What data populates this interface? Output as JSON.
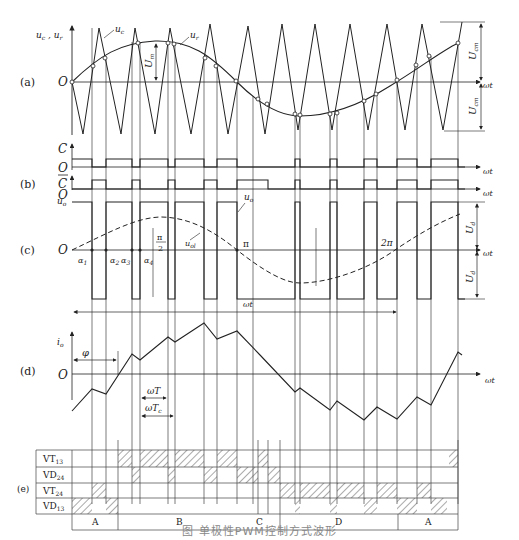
{
  "figure": {
    "caption": "图  单极性PWM控制方式波形",
    "panels": {
      "a": {
        "tag": "(a)",
        "y_axis_label": "u_c , u_r",
        "origin_label": "O",
        "x_axis_label": "ωt",
        "carrier_label": "u_c",
        "reference_label": "u_r",
        "amplitude_label_ref": "U_m",
        "amplitude_label_carrier_pos": "U_cm",
        "amplitude_label_carrier_neg": "U_cm"
      },
      "b": {
        "tag": "(b)",
        "signal_c_label": "C",
        "signal_cbar_label": "C̄",
        "origin_label_c": "O",
        "origin_label_cbar": "O",
        "x_axis_label_c": "ωt",
        "x_axis_label_cbar": "ωt"
      },
      "c": {
        "tag": "(c)",
        "y_axis_label": "u_o",
        "origin_label": "O",
        "output_label": "u_o",
        "fundamental_label": "u_ol",
        "angle_labels": [
          "α1",
          "α2",
          "α3",
          "α4"
        ],
        "half_pi_label_num": "π",
        "half_pi_label_den": "2",
        "pi_label": "π",
        "two_pi_label": "2π",
        "x_axis_label": "ωt",
        "period_arrow_label": "ωt",
        "dc_label_pos": "U_d",
        "dc_label_neg": "U_d"
      },
      "d": {
        "tag": "(d)",
        "y_axis_label": "i_o",
        "origin_label": "O",
        "phase_label": "φ",
        "switch_period_label": "ωT",
        "carrier_period_label": "ωT_c",
        "x_axis_label": "ωt"
      },
      "e": {
        "tag": "(e)",
        "rows": [
          "VT13",
          "VD24",
          "VT24",
          "VD13"
        ],
        "row_labels": [
          {
            "main": "VT",
            "sub": "13"
          },
          {
            "main": "VD",
            "sub": "24"
          },
          {
            "main": "VT",
            "sub": "24"
          },
          {
            "main": "VD",
            "sub": "13"
          }
        ],
        "intervals": [
          {
            "label": "A"
          },
          {
            "label": "B"
          },
          {
            "label": "C"
          },
          {
            "label": "D"
          },
          {
            "label": "A"
          }
        ]
      }
    }
  }
}
